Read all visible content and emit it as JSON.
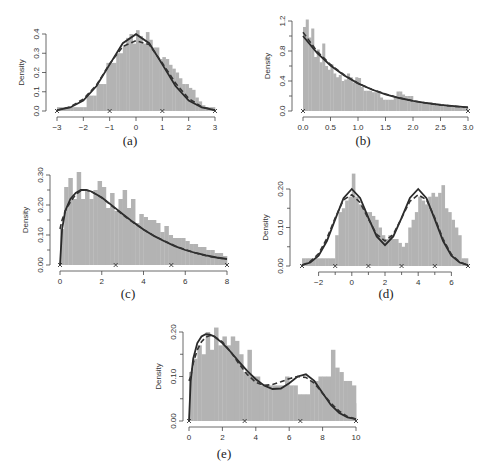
{
  "figure": {
    "ylabel": "Density",
    "colors": {
      "histogram": "#b3b3b3",
      "true_density": "#2a2a2a",
      "estimate": "#333333",
      "axis": "#444444"
    }
  },
  "chart_data": [
    {
      "id": "a",
      "caption": "(a)",
      "type": "bar",
      "description": "Histogram with standard normal density (solid) and estimated density (dashed)",
      "xlabel": "",
      "ylabel": "Density",
      "xlim": [
        -3,
        3
      ],
      "ylim": [
        0,
        0.4
      ],
      "xticks": [
        -3,
        -2,
        -1,
        0,
        1,
        2,
        3
      ],
      "xtick_labels": [
        "−3",
        "−2",
        "−1",
        "0",
        "1",
        "2",
        "3"
      ],
      "yticks": [
        0.0,
        0.1,
        0.2,
        0.3,
        0.4
      ],
      "ytick_labels": [
        "0.0",
        "0.1",
        "0.2",
        "0.3",
        "0.4"
      ],
      "knots": [
        -3,
        -1,
        1,
        3
      ],
      "bins": {
        "start": -3,
        "width": 0.125,
        "values": [
          0.02,
          0.02,
          0.02,
          0.02,
          0.02,
          0.02,
          0.02,
          0.02,
          0.02,
          0.08,
          0.08,
          0.08,
          0.14,
          0.14,
          0.14,
          0.25,
          0.25,
          0.25,
          0.3,
          0.3,
          0.34,
          0.38,
          0.4,
          0.35,
          0.42,
          0.39,
          0.35,
          0.41,
          0.37,
          0.33,
          0.33,
          0.27,
          0.28,
          0.27,
          0.24,
          0.22,
          0.2,
          0.17,
          0.14,
          0.14,
          0.12,
          0.11,
          0.07,
          0.05,
          0.03,
          0.02,
          0.02,
          0.02
        ]
      },
      "series": [
        {
          "name": "true density",
          "style": "solid",
          "x": [
            -3,
            -2.5,
            -2,
            -1.5,
            -1,
            -0.5,
            0,
            0.5,
            1,
            1.5,
            2,
            2.5,
            3
          ],
          "y": [
            0.004,
            0.018,
            0.054,
            0.13,
            0.242,
            0.352,
            0.399,
            0.352,
            0.242,
            0.13,
            0.054,
            0.018,
            0.004
          ]
        },
        {
          "name": "estimate",
          "style": "dashed",
          "x": [
            -3,
            -2.5,
            -2,
            -1.5,
            -1,
            -0.5,
            0,
            0.5,
            1,
            1.5,
            2,
            2.5,
            3
          ],
          "y": [
            0.004,
            0.022,
            0.062,
            0.135,
            0.245,
            0.335,
            0.365,
            0.345,
            0.25,
            0.145,
            0.065,
            0.022,
            0.004
          ]
        }
      ]
    },
    {
      "id": "b",
      "caption": "(b)",
      "type": "bar",
      "description": "Histogram with exponential density (solid) and estimate (dashed)",
      "xlabel": "",
      "ylabel": "Density",
      "xlim": [
        0,
        3
      ],
      "ylim": [
        0,
        1.2
      ],
      "xticks": [
        0.0,
        0.5,
        1.0,
        1.5,
        2.0,
        2.5,
        3.0
      ],
      "xtick_labels": [
        "0.0",
        "0.5",
        "1.0",
        "1.5",
        "2.0",
        "2.5",
        "3.0"
      ],
      "yticks": [
        0.0,
        0.4,
        0.8,
        1.2
      ],
      "ytick_labels": [
        "0.0",
        "0.4",
        "0.8",
        "1.2"
      ],
      "minor_yticks": [
        0.2,
        0.6,
        1.0
      ],
      "knots": [
        0,
        3
      ],
      "bins": {
        "start": 0,
        "width": 0.05,
        "values": [
          1.12,
          1.22,
          0.98,
          1.1,
          0.72,
          0.82,
          0.65,
          0.9,
          0.6,
          0.55,
          0.62,
          0.5,
          0.45,
          0.48,
          0.4,
          0.42,
          0.5,
          0.45,
          0.38,
          0.45,
          0.44,
          0.32,
          0.27,
          0.27,
          0.27,
          0.25,
          0.25,
          0.25,
          0.18,
          0.15,
          0.15,
          0.15,
          0.15,
          0.18,
          0.26,
          0.26,
          0.22,
          0.2,
          0.2,
          0.2,
          0.12,
          0.12,
          0.12,
          0.12,
          0.12,
          0.12,
          0.12,
          0.1,
          0.1,
          0.1,
          0.08,
          0.08,
          0.08,
          0.07,
          0.07,
          0.06,
          0.05,
          0.05,
          0.05,
          0.05
        ]
      },
      "series": [
        {
          "name": "true density",
          "style": "solid",
          "x": [
            0,
            0.25,
            0.5,
            0.75,
            1,
            1.25,
            1.5,
            1.75,
            2,
            2.25,
            2.5,
            2.75,
            3
          ],
          "y": [
            1.0,
            0.779,
            0.607,
            0.472,
            0.368,
            0.287,
            0.223,
            0.174,
            0.135,
            0.105,
            0.082,
            0.064,
            0.05
          ]
        },
        {
          "name": "estimate",
          "style": "dashed",
          "x": [
            0,
            0.25,
            0.5,
            0.75,
            1,
            1.25,
            1.5,
            1.75,
            2,
            2.25,
            2.5,
            2.75,
            3
          ],
          "y": [
            1.05,
            0.8,
            0.62,
            0.48,
            0.37,
            0.29,
            0.225,
            0.175,
            0.135,
            0.105,
            0.08,
            0.062,
            0.048
          ]
        }
      ]
    },
    {
      "id": "c",
      "caption": "(c)",
      "type": "bar",
      "description": "Histogram with gamma-like right-skewed density (solid) and estimate (dashed)",
      "xlabel": "",
      "ylabel": "Density",
      "xlim": [
        0,
        8
      ],
      "ylim": [
        0,
        0.3
      ],
      "xticks": [
        0,
        2,
        4,
        6,
        8
      ],
      "xtick_labels": [
        "0",
        "2",
        "4",
        "6",
        "8"
      ],
      "yticks": [
        0.0,
        0.1,
        0.2,
        0.3
      ],
      "ytick_labels": [
        "0.00",
        "0.10",
        "0.20",
        "0.30"
      ],
      "minor_yticks": [
        0.05,
        0.15,
        0.25
      ],
      "knots": [
        0,
        2.667,
        5.333,
        8
      ],
      "bins": {
        "start": 0,
        "width": 0.2,
        "values": [
          0.12,
          0.26,
          0.29,
          0.22,
          0.31,
          0.22,
          0.25,
          0.22,
          0.25,
          0.28,
          0.26,
          0.19,
          0.24,
          0.18,
          0.22,
          0.25,
          0.19,
          0.22,
          0.14,
          0.17,
          0.16,
          0.15,
          0.15,
          0.14,
          0.11,
          0.13,
          0.1,
          0.09,
          0.09,
          0.09,
          0.08,
          0.07,
          0.07,
          0.06,
          0.06,
          0.05,
          0.05,
          0.04,
          0.04,
          0.03
        ]
      },
      "series": [
        {
          "name": "true density",
          "style": "solid",
          "x": [
            0,
            0.1,
            0.25,
            0.5,
            0.75,
            1,
            1.25,
            1.5,
            2,
            2.5,
            3,
            3.5,
            4,
            4.5,
            5,
            5.5,
            6,
            6.5,
            7,
            7.5,
            8
          ],
          "y": [
            0,
            0.12,
            0.18,
            0.22,
            0.24,
            0.25,
            0.25,
            0.245,
            0.225,
            0.198,
            0.17,
            0.143,
            0.118,
            0.097,
            0.079,
            0.063,
            0.05,
            0.04,
            0.032,
            0.025,
            0.02
          ]
        },
        {
          "name": "estimate",
          "style": "dashed",
          "x": [
            0,
            0.1,
            0.25,
            0.5,
            0.75,
            1,
            1.25,
            1.5,
            2,
            2.5,
            3,
            3.5,
            4,
            4.5,
            5,
            5.5,
            6,
            6.5,
            7,
            7.5,
            8
          ],
          "y": [
            0.12,
            0.15,
            0.18,
            0.21,
            0.235,
            0.248,
            0.25,
            0.245,
            0.224,
            0.196,
            0.168,
            0.142,
            0.118,
            0.098,
            0.08,
            0.064,
            0.051,
            0.04,
            0.031,
            0.024,
            0.02
          ]
        }
      ]
    },
    {
      "id": "d",
      "caption": "(d)",
      "type": "bar",
      "description": "Histogram with bimodal normal mixture density (solid) and estimate (dashed)",
      "xlabel": "",
      "ylabel": "Density",
      "xlim": [
        -3,
        7
      ],
      "ylim": [
        0,
        0.2
      ],
      "xticks": [
        -2,
        0,
        2,
        4,
        6
      ],
      "xtick_labels": [
        "−2",
        "0",
        "2",
        "4",
        "6"
      ],
      "minor_xticks": [
        -1,
        1,
        3,
        5
      ],
      "yticks": [
        0.0,
        0.1,
        0.2
      ],
      "ytick_labels": [
        "0.00",
        "0.10",
        "0.20"
      ],
      "minor_yticks": [
        0.05,
        0.15
      ],
      "knots": [
        -3,
        -1,
        1,
        3,
        5,
        7
      ],
      "bins": {
        "start": -3,
        "width": 0.2,
        "values": [
          0.02,
          0.02,
          0.02,
          0.02,
          0.02,
          0.02,
          0.02,
          0.02,
          0.02,
          0.02,
          0.08,
          0.14,
          0.15,
          0.17,
          0.18,
          0.24,
          0.18,
          0.16,
          0.15,
          0.14,
          0.14,
          0.13,
          0.12,
          0.1,
          0.08,
          0.07,
          0.08,
          0.07,
          0.07,
          0.06,
          0.05,
          0.06,
          0.1,
          0.12,
          0.14,
          0.18,
          0.17,
          0.16,
          0.18,
          0.19,
          0.18,
          0.19,
          0.21,
          0.15,
          0.14,
          0.12,
          0.1,
          0.08,
          0.02,
          0.02
        ]
      },
      "series": [
        {
          "name": "true density",
          "style": "solid",
          "x": [
            -3,
            -2.5,
            -2,
            -1.5,
            -1,
            -0.5,
            0,
            0.5,
            1,
            1.5,
            2,
            2.5,
            3,
            3.5,
            4,
            4.5,
            5,
            5.5,
            6,
            6.5,
            7
          ],
          "y": [
            0.002,
            0.009,
            0.027,
            0.065,
            0.121,
            0.176,
            0.2,
            0.177,
            0.125,
            0.077,
            0.054,
            0.077,
            0.125,
            0.177,
            0.2,
            0.176,
            0.121,
            0.065,
            0.027,
            0.009,
            0.002
          ]
        },
        {
          "name": "estimate",
          "style": "dashed",
          "x": [
            -3,
            -2.5,
            -2,
            -1.5,
            -1,
            -0.5,
            0,
            0.5,
            1,
            1.5,
            2,
            2.5,
            3,
            3.5,
            4,
            4.5,
            5,
            5.5,
            6,
            6.5,
            7
          ],
          "y": [
            0.002,
            0.012,
            0.032,
            0.072,
            0.125,
            0.172,
            0.185,
            0.165,
            0.122,
            0.082,
            0.065,
            0.082,
            0.125,
            0.168,
            0.185,
            0.172,
            0.125,
            0.07,
            0.03,
            0.01,
            0.002
          ]
        }
      ]
    },
    {
      "id": "e",
      "caption": "(e)",
      "type": "bar",
      "description": "Histogram with skewed bimodal density (solid) and estimate (dashed)",
      "xlabel": "",
      "ylabel": "Density",
      "xlim": [
        0,
        10
      ],
      "ylim": [
        0,
        0.2
      ],
      "xticks": [
        0,
        2,
        4,
        6,
        8,
        10
      ],
      "xtick_labels": [
        "0",
        "2",
        "4",
        "6",
        "8",
        "10"
      ],
      "yticks": [
        0.0,
        0.1,
        0.2
      ],
      "ytick_labels": [
        "0.00",
        "0.10",
        "0.20"
      ],
      "minor_yticks": [
        0.05,
        0.15
      ],
      "knots": [
        0,
        3.333,
        6.667,
        10
      ],
      "bins": {
        "start": 0,
        "width": 0.25,
        "values": [
          0.11,
          0.14,
          0.17,
          0.15,
          0.2,
          0.16,
          0.21,
          0.17,
          0.19,
          0.17,
          0.19,
          0.18,
          0.15,
          0.11,
          0.16,
          0.1,
          0.1,
          0.08,
          0.08,
          0.08,
          0.08,
          0.08,
          0.08,
          0.1,
          0.08,
          0.08,
          0.06,
          0.06,
          0.06,
          0.09,
          0.09,
          0.1,
          0.1,
          0.1,
          0.16,
          0.12,
          0.11,
          0.09,
          0.09,
          0.08,
          0.04,
          0.04,
          0.04,
          0.02,
          0.02,
          0.02,
          0.02,
          0.02,
          0.02,
          0.02
        ]
      },
      "series": [
        {
          "name": "true density",
          "style": "solid",
          "x": [
            0,
            0.1,
            0.25,
            0.5,
            0.75,
            1,
            1.25,
            1.5,
            2,
            2.5,
            3,
            3.5,
            4,
            4.5,
            5,
            5.5,
            6,
            6.5,
            7,
            7.5,
            8,
            8.5,
            9,
            9.5,
            10
          ],
          "y": [
            0,
            0.09,
            0.14,
            0.175,
            0.19,
            0.195,
            0.194,
            0.19,
            0.175,
            0.155,
            0.133,
            0.112,
            0.094,
            0.08,
            0.072,
            0.073,
            0.085,
            0.1,
            0.105,
            0.09,
            0.063,
            0.036,
            0.018,
            0.008,
            0.004
          ]
        },
        {
          "name": "estimate",
          "style": "dashed",
          "x": [
            0,
            0.1,
            0.25,
            0.5,
            0.75,
            1,
            1.25,
            1.5,
            2,
            2.5,
            3,
            3.5,
            4,
            4.5,
            5,
            5.5,
            6,
            6.5,
            7,
            7.5,
            8,
            8.5,
            9,
            9.5,
            10
          ],
          "y": [
            0.09,
            0.1,
            0.13,
            0.16,
            0.178,
            0.188,
            0.192,
            0.19,
            0.178,
            0.155,
            0.128,
            0.104,
            0.087,
            0.08,
            0.082,
            0.088,
            0.095,
            0.1,
            0.098,
            0.085,
            0.062,
            0.04,
            0.022,
            0.01,
            0.004
          ]
        }
      ]
    }
  ],
  "panels_layout": [
    {
      "id": "a",
      "x0": 57,
      "x1": 215,
      "y0": 111,
      "y1": 34,
      "yaxis_x": 46,
      "caption_x": 130,
      "caption_y": 145
    },
    {
      "id": "b",
      "x0": 303,
      "x1": 468,
      "y0": 111,
      "y1": 21,
      "yaxis_x": 292,
      "caption_x": 363,
      "caption_y": 145
    },
    {
      "id": "c",
      "x0": 60,
      "x1": 227,
      "y0": 265,
      "y1": 175,
      "yaxis_x": 50,
      "caption_x": 128,
      "caption_y": 298
    },
    {
      "id": "d",
      "x0": 302,
      "x1": 468,
      "y0": 266,
      "y1": 189,
      "yaxis_x": 290,
      "caption_x": 386,
      "caption_y": 298
    },
    {
      "id": "e",
      "x0": 189,
      "x1": 356,
      "y0": 421,
      "y1": 332,
      "yaxis_x": 183,
      "caption_x": 224,
      "caption_y": 458
    }
  ]
}
